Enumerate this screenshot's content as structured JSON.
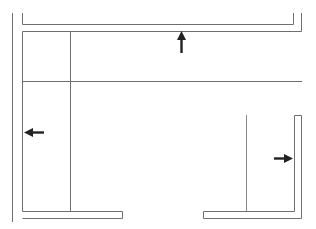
{
  "diagram": {
    "type": "floor-plan",
    "colors": {
      "wall": "#6f6f6f",
      "arrow": "#222222",
      "background": "#ffffff"
    },
    "arrows": [
      {
        "id": "up",
        "direction": "up",
        "icon": "arrow-up-icon"
      },
      {
        "id": "left",
        "direction": "left",
        "icon": "arrow-left-icon"
      },
      {
        "id": "right",
        "direction": "right",
        "icon": "arrow-right-icon"
      }
    ]
  }
}
